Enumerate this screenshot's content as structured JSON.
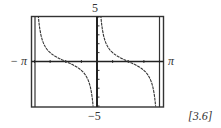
{
  "chart_data": {
    "type": "line",
    "title": "",
    "function": "cot(x)",
    "xlabel": "",
    "ylabel": "",
    "xlim": [
      -3.14159,
      3.14159
    ],
    "ylim": [
      -5,
      5
    ],
    "x_tick_labels": {
      "min": "−π",
      "max": "π"
    },
    "y_tick_labels": {
      "max": "5",
      "min": "−5"
    },
    "x_tick_count_each_side": 4,
    "y_tick_count_each_side": 5,
    "grid": false,
    "asymptotes_x": [
      -3.14159,
      0,
      3.14159
    ],
    "zeros_x": [
      -1.5708,
      1.5708
    ],
    "series": [
      {
        "name": "branch-left",
        "x": [
          -3.0,
          -2.8,
          -2.5,
          -2.2,
          -2.0,
          -1.8,
          -1.5708,
          -1.3,
          -1.0,
          -0.7,
          -0.5,
          -0.3,
          -0.2
        ],
        "values": [
          -7.02,
          -2.81,
          -1.34,
          -0.73,
          0.46,
          0.23,
          0.0,
          -0.28,
          -0.64,
          -1.19,
          -1.83,
          -3.23,
          -4.93
        ]
      },
      {
        "name": "branch-right",
        "x": [
          0.2,
          0.3,
          0.5,
          0.7,
          1.0,
          1.3,
          1.5708,
          1.8,
          2.0,
          2.2,
          2.5,
          2.8,
          3.0
        ],
        "values": [
          4.93,
          3.23,
          1.83,
          1.19,
          0.64,
          0.28,
          0.0,
          -0.23,
          -0.46,
          -0.73,
          -1.34,
          -2.81,
          -7.02
        ]
      }
    ],
    "colors": {
      "curve": "#333333",
      "axes": "#222222",
      "frame": "#333333"
    }
  },
  "labels": {
    "y_max": "5",
    "y_min": "−5",
    "x_min": "− π",
    "x_max": "π",
    "figure_ref": "[3.6]"
  }
}
